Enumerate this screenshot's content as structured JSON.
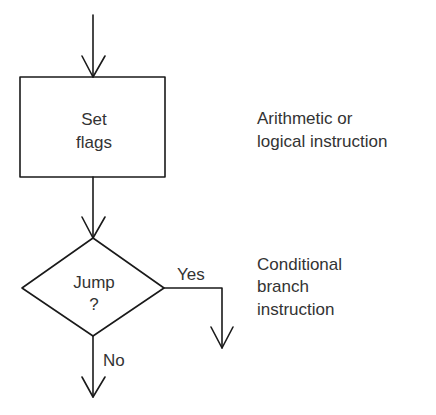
{
  "diagram": {
    "type": "flowchart",
    "nodes": [
      {
        "id": "set-flags",
        "shape": "rectangle",
        "lines": [
          "Set",
          "flags"
        ]
      },
      {
        "id": "jump",
        "shape": "diamond",
        "lines": [
          "Jump",
          "?"
        ]
      }
    ],
    "edges": [
      {
        "from": "entry",
        "to": "set-flags",
        "label": ""
      },
      {
        "from": "set-flags",
        "to": "jump",
        "label": ""
      },
      {
        "from": "jump",
        "to": "yes-exit",
        "label": "Yes"
      },
      {
        "from": "jump",
        "to": "no-exit",
        "label": "No"
      }
    ],
    "annotations": [
      {
        "target": "set-flags",
        "lines": [
          "Arithmetic or",
          "logical instruction"
        ]
      },
      {
        "target": "jump",
        "lines": [
          "Conditional",
          "branch",
          "instruction"
        ]
      }
    ],
    "colors": {
      "line": "#1a1a1a",
      "text": "#333333",
      "background": "#ffffff"
    }
  }
}
